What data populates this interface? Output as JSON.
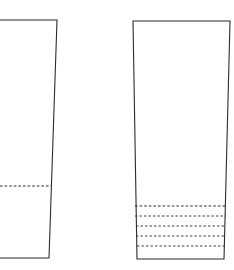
{
  "figure": {
    "canvas": {
      "width": 234,
      "height": 270,
      "background": "#ffffff"
    },
    "stroke_color": "#2b2b2b",
    "dash_color": "#3a3a3a"
  },
  "chart_data": {
    "type": "diagram",
    "xlabel": "",
    "ylabel": "",
    "grid": false,
    "legend": null,
    "shapes": [
      {
        "name": "left-vessel",
        "label": "Left vessel (clipped at image edge)",
        "clipped_edge": "left",
        "outline_points": "0,20 57,20 49,258 0,258",
        "top_y": 20,
        "bottom_y": 258,
        "top_right_x": 57,
        "bottom_right_x": 49,
        "dash_line_count": 1
      },
      {
        "name": "right-vessel",
        "label": "Right vessel (complete)",
        "clipped_edge": "none",
        "outline_points": "133,21 230,21 224,259 137,259",
        "top_y": 21,
        "bottom_y": 259,
        "top_left_x": 133,
        "top_right_x": 230,
        "bottom_left_x": 137,
        "bottom_right_x": 224,
        "dash_line_count": 5
      }
    ],
    "dashed_lines": [
      {
        "shape": "left-vessel",
        "index": 0,
        "role": "fill-level",
        "y": 186,
        "x1": 0,
        "x2": 52
      },
      {
        "shape": "right-vessel",
        "index": 0,
        "role": "fill-level",
        "y": 206,
        "x1": 135,
        "x2": 227
      },
      {
        "shape": "right-vessel",
        "index": 1,
        "role": "graduation",
        "y": 216,
        "x1": 135,
        "x2": 226
      },
      {
        "shape": "right-vessel",
        "index": 2,
        "role": "graduation",
        "y": 226,
        "x1": 136,
        "x2": 226
      },
      {
        "shape": "right-vessel",
        "index": 3,
        "role": "graduation",
        "y": 236,
        "x1": 136,
        "x2": 225
      },
      {
        "shape": "right-vessel",
        "index": 4,
        "role": "graduation",
        "y": 246,
        "x1": 137,
        "x2": 225
      }
    ]
  }
}
